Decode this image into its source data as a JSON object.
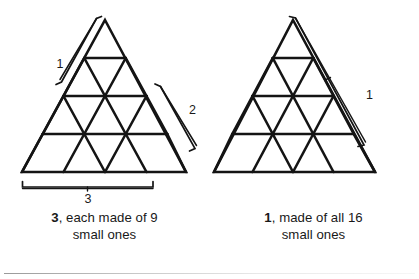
{
  "figure": {
    "name": "triangle-subdivision-figure",
    "background": "#ffffff",
    "ink_color": "#141414",
    "rule_color": "#8a8a8a"
  },
  "panels": [
    {
      "id": "left",
      "triangle": {
        "rows": 4,
        "small_triangles": 16,
        "apex": {
          "x": 105,
          "y": 20
        },
        "base_left": {
          "x": 22,
          "y": 172
        },
        "base_right": {
          "x": 186,
          "y": 172
        }
      },
      "braces": [
        {
          "id": "brace-size-1",
          "label": "1",
          "side": "upper-left",
          "label_x": 60,
          "label_y": 68,
          "units": 1
        },
        {
          "id": "brace-size-2",
          "label": "2",
          "side": "lower-right",
          "label_x": 189,
          "label_y": 114,
          "units": 2
        },
        {
          "id": "brace-size-3",
          "label": "3",
          "side": "bottom",
          "label_x": 88,
          "label_y": 202,
          "units": 3
        }
      ],
      "caption": {
        "count": "3",
        "rest": ", each made of 9",
        "line2": "small ones"
      }
    },
    {
      "id": "right",
      "triangle": {
        "rows": 4,
        "small_triangles": 16,
        "apex": {
          "x": 84,
          "y": 20
        },
        "base_left": {
          "x": 5,
          "y": 172
        },
        "base_right": {
          "x": 166,
          "y": 172
        }
      },
      "braces": [
        {
          "id": "brace-size-4",
          "label": "1",
          "side": "right",
          "label_x": 157,
          "label_y": 99,
          "units": 4
        }
      ],
      "caption": {
        "count": "1",
        "rest": ", made of all 16",
        "line2": "small ones"
      }
    }
  ]
}
